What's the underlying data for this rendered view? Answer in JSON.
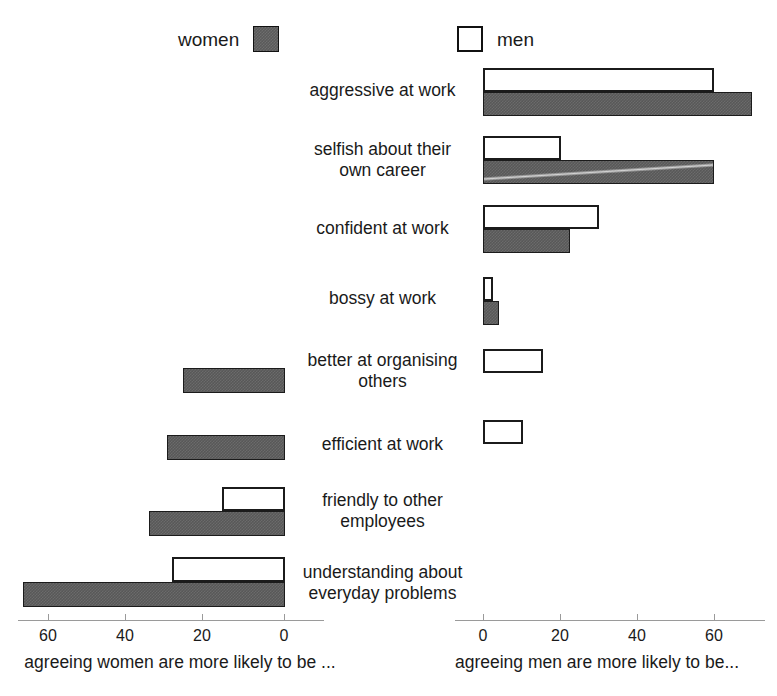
{
  "chart_data": {
    "type": "bar",
    "orientation": "horizontal",
    "style": "bidirectional-tornado",
    "title": "",
    "subtitle": "",
    "categories": [
      "aggressive at work",
      "selfish about their own career",
      "confident at work",
      "bossy at work",
      "better at organising others",
      "efficient at work",
      "friendly to other employees",
      "understanding about everyday problems"
    ],
    "series": [
      {
        "name": "women",
        "swatch": "filled",
        "color": "#585858",
        "values_left": [
          0,
          0,
          0,
          0,
          26,
          30,
          34.5,
          66.5
        ],
        "values_right": [
          70,
          60,
          22.5,
          4,
          0,
          0,
          0,
          0
        ]
      },
      {
        "name": "men",
        "swatch": "hollow",
        "color": "#ffffff",
        "values_left": [
          0,
          0,
          0,
          0,
          0,
          0,
          16,
          28.5
        ],
        "values_right": [
          60,
          20,
          30,
          2.5,
          15.5,
          10,
          0,
          0
        ]
      }
    ],
    "left_axis": {
      "title": "agreeing women are more likely to be ...",
      "ticks": [
        60,
        40,
        20,
        0
      ],
      "range": [
        0,
        70
      ],
      "direction": "right-to-left"
    },
    "right_axis": {
      "title": "agreeing men are more likely to be...",
      "ticks": [
        0,
        20,
        40,
        60
      ],
      "range": [
        0,
        75
      ],
      "direction": "left-to-right"
    },
    "grid": false,
    "legend": {
      "position": "top",
      "entries": [
        "women",
        "men"
      ]
    }
  },
  "legend": {
    "women_label": "women",
    "men_label": "men"
  },
  "rows": [
    {
      "label": "aggressive at work"
    },
    {
      "label": "selfish about their\nown career"
    },
    {
      "label": "confident at work"
    },
    {
      "label": "bossy at work"
    },
    {
      "label": "better at organising\nothers"
    },
    {
      "label": "efficient at work"
    },
    {
      "label": "friendly to other\nemployees"
    },
    {
      "label": "understanding about\neveryday problems"
    }
  ],
  "left_axis": {
    "title": "agreeing women are more likely to be ...",
    "tick_labels": [
      "60",
      "40",
      "20",
      "0"
    ]
  },
  "right_axis": {
    "title": "agreeing men are more likely to be...",
    "tick_labels": [
      "0",
      "20",
      "40",
      "60"
    ]
  }
}
